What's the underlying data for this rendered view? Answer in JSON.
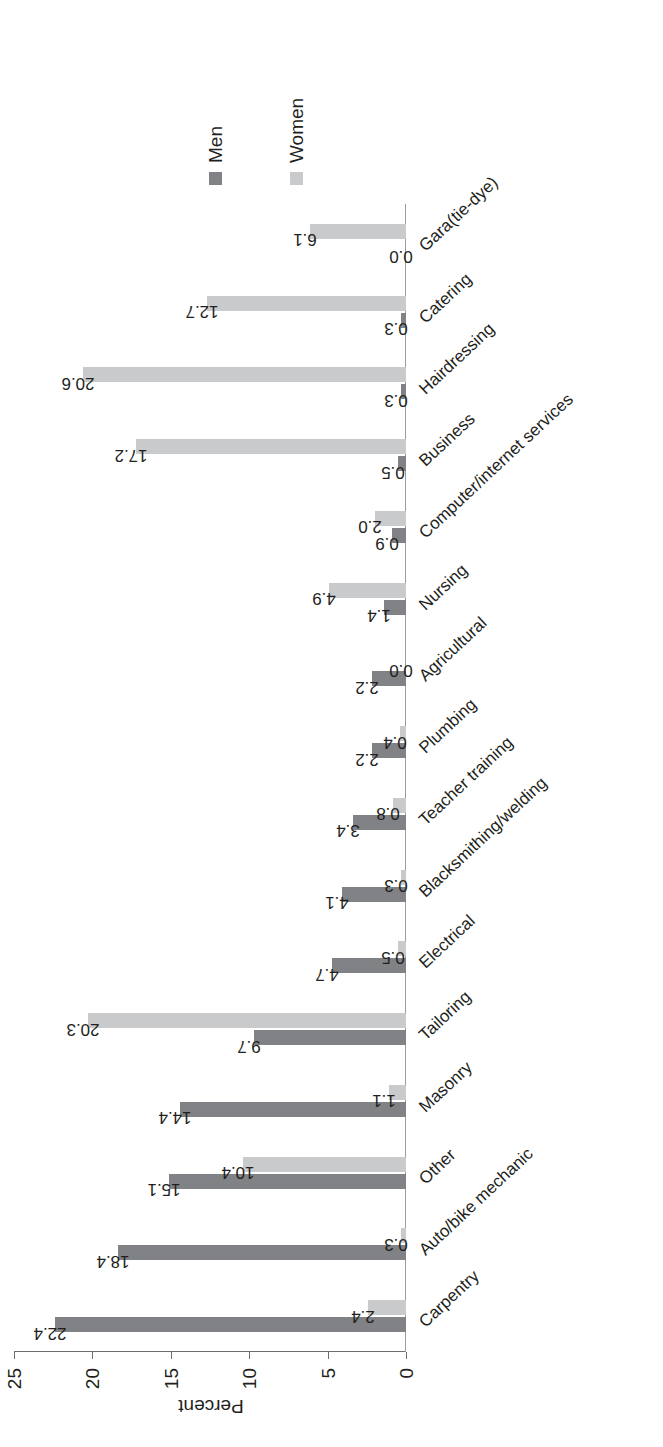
{
  "chart_data": {
    "type": "bar",
    "title": "",
    "subtitle": "",
    "xlabel": "",
    "ylabel": "Percent",
    "ylim": [
      0,
      25
    ],
    "yticks": [
      "0",
      "5",
      "10",
      "15",
      "20",
      "25"
    ],
    "grid": false,
    "legend_position": "right",
    "orientation": "rotated-90-ccw",
    "categories": [
      "Carpentry",
      "Auto/bike mechanic",
      "Other",
      "Masonry",
      "Tailoring",
      "Electrical",
      "Blacksmithing/welding",
      "Teacher training",
      "Plumbing",
      "Agricultural",
      "Nursing",
      "Computer/internet services",
      "Business",
      "Hairdressing",
      "Catering",
      "Gara(tie-dye)"
    ],
    "series": [
      {
        "name": "Men",
        "color": "#808285",
        "values": [
          22.4,
          18.4,
          15.1,
          14.4,
          9.7,
          4.7,
          4.1,
          3.4,
          2.2,
          2.2,
          1.4,
          0.9,
          0.5,
          0.3,
          0.3,
          0.0
        ]
      },
      {
        "name": "Women",
        "color": "#c9cacc",
        "values": [
          2.4,
          0.3,
          10.4,
          1.1,
          20.3,
          0.5,
          0.3,
          0.8,
          0.4,
          0.0,
          4.9,
          2.0,
          17.2,
          20.6,
          12.7,
          6.1
        ]
      }
    ],
    "value_labels": {
      "Carpentry": {
        "Men": "22.4",
        "Women": "2.4"
      },
      "Auto/bike mechanic": {
        "Men": "18.4",
        "Women": "0.3"
      },
      "Other": {
        "Men": "15.1",
        "Women": "10.4"
      },
      "Masonry": {
        "Men": "14.4",
        "Women": "1.1"
      },
      "Tailoring": {
        "Men": "9.7",
        "Women": "20.3"
      },
      "Electrical": {
        "Men": "4.7",
        "Women": "0.5"
      },
      "Blacksmithing/welding": {
        "Men": "4.1",
        "Women": "0.3"
      },
      "Teacher training": {
        "Men": "3.4",
        "Women": "0.8"
      },
      "Plumbing": {
        "Men": "2.2",
        "Women": "0.4"
      },
      "Agricultural": {
        "Men": "2.2",
        "Women": "0.0"
      },
      "Nursing": {
        "Men": "1.4",
        "Women": "4.9"
      },
      "Computer/internet services": {
        "Men": "0.9",
        "Women": "2.0"
      },
      "Business": {
        "Men": "0.5",
        "Women": "17.2"
      },
      "Hairdressing": {
        "Men": "0.3",
        "Women": "20.6"
      },
      "Catering": {
        "Men": "0.3",
        "Women": "12.7"
      },
      "Gara(tie-dye)": {
        "Men": "0.0",
        "Women": "6.1"
      }
    }
  },
  "legend": {
    "items": [
      {
        "label": "Men",
        "color": "#808285"
      },
      {
        "label": "Women",
        "color": "#c9cacc"
      }
    ]
  },
  "axis": {
    "y_title": "Percent",
    "y_ticks": [
      "0",
      "5",
      "10",
      "15",
      "20",
      "25"
    ]
  },
  "colors": {
    "men": "#808285",
    "women": "#c9cacc",
    "axis": "#6d6e71",
    "text": "#231f20",
    "background": "#ffffff"
  }
}
